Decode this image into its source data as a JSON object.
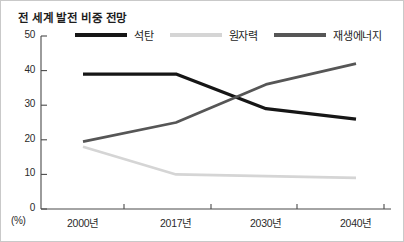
{
  "chart_data": {
    "type": "line",
    "title": "전 세계 발전 비중 전망",
    "xlabel": "",
    "ylabel": "",
    "unit_label": "(%)",
    "categories": [
      "2000년",
      "2017년",
      "2030년",
      "2040년"
    ],
    "yticks": [
      "0",
      "10",
      "20",
      "30",
      "40",
      "50"
    ],
    "ylim": [
      0,
      50
    ],
    "grid": false,
    "legend_position": "top",
    "series": [
      {
        "name": "석탄",
        "color": "#161616",
        "values": [
          39,
          39,
          29,
          26
        ]
      },
      {
        "name": "원자력",
        "color": "#d5d5d5",
        "values": [
          18,
          10,
          9.5,
          9
        ]
      },
      {
        "name": "재생에너지",
        "color": "#565656",
        "values": [
          19.5,
          25,
          36,
          42
        ]
      }
    ]
  }
}
